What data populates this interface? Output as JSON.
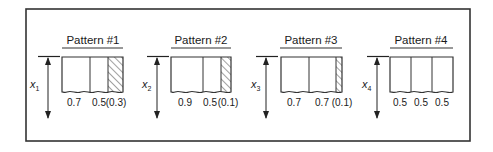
{
  "diagram": {
    "line_color": "#333333",
    "hatch_color": "#444444",
    "patterns": [
      {
        "title": "Pattern #1",
        "variable": "x",
        "subscript": "1",
        "pieces": [
          "0.7",
          "0.5"
        ],
        "waste": "(0.3)",
        "label_text": "0.7   0.5 (0.3)"
      },
      {
        "title": "Pattern #2",
        "variable": "x",
        "subscript": "2",
        "pieces": [
          "0.9",
          "0.5"
        ],
        "waste": "(0.1)",
        "label_text": "0.9   0.5 (0.1)"
      },
      {
        "title": "Pattern #3",
        "variable": "x",
        "subscript": "3",
        "pieces": [
          "0.7",
          "0.7"
        ],
        "waste": "(0.1)",
        "label_text": "0.7   0.7 (0.1)"
      },
      {
        "title": "Pattern #4",
        "variable": "x",
        "subscript": "4",
        "pieces": [
          "0.5",
          "0.5",
          "0.5"
        ],
        "waste": "",
        "label_text": "0.5  0.5  0.5"
      }
    ]
  }
}
